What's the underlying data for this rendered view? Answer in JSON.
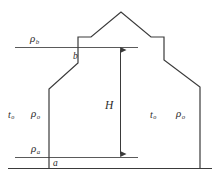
{
  "figure": {
    "title": "",
    "background_color": "#ffffff",
    "line_color": "#3a3a3a",
    "text_color": "#2b2b2b",
    "width": 217,
    "height": 188
  },
  "labels": {
    "rho_b": {
      "symbol": "ρ",
      "subscript": "b"
    },
    "rho_a": {
      "symbol": "ρ",
      "subscript": "a"
    },
    "rho_left": {
      "symbol": "ρ",
      "subscript": "o"
    },
    "rho_right": {
      "symbol": "ρ",
      "subscript": "o"
    },
    "t_left": {
      "symbol": "t",
      "subscript": "o"
    },
    "t_right": {
      "symbol": "t",
      "subscript": "o"
    },
    "point_a": "a",
    "point_b": "b",
    "height_H": "H"
  },
  "geometry": {
    "building_outline": "49,168 49,89 78,63 78,44 78,37 91,37 121,12 151,37 164,37 164,52 164,60 200,87 200,168",
    "baseline": {
      "x1": 8,
      "y1": 168,
      "x2": 212,
      "y2": 168
    },
    "upper_reference_line": {
      "x1": 15,
      "y1": 47,
      "x2": 138,
      "y2": 47
    },
    "lower_reference_line": {
      "x1": 15,
      "y1": 157,
      "x2": 138,
      "y2": 157
    },
    "height_arrow": {
      "x": 120,
      "y_top": 47,
      "y_bottom": 157
    }
  }
}
